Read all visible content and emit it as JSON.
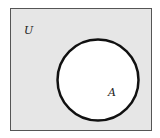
{
  "diagram": {
    "type": "venn",
    "universe": {
      "label": "U",
      "fill": "#e6e6e6",
      "stroke": "#555555"
    },
    "sets": [
      {
        "label": "A",
        "fill": "#ffffff",
        "stroke": "#111111"
      }
    ]
  }
}
